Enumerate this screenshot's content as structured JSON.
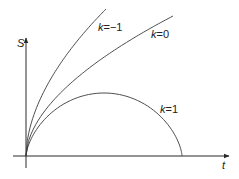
{
  "diagram": {
    "title": "",
    "colors": {
      "axis": "#2a2a2a",
      "curve": "#3a3a3a",
      "background": "#ffffff"
    },
    "origin_px": [
      26,
      156
    ],
    "axes": {
      "y": {
        "label": "S",
        "top_px": 38,
        "label_px": [
          17,
          47
        ]
      },
      "x": {
        "label": "t",
        "left_px": 13,
        "right_px": 229,
        "label_px": [
          222,
          169
        ]
      }
    },
    "curves": [
      {
        "id": "k_minus_1",
        "label_k": "k",
        "label_eq": "=−1",
        "label_px": [
          98,
          31
        ],
        "shape": "power",
        "end_px": [
          106,
          9
        ],
        "exponent": 0.55
      },
      {
        "id": "k_0",
        "label_k": "k",
        "label_eq": "=0",
        "label_px": [
          151,
          38
        ],
        "shape": "power",
        "end_px": [
          173,
          16
        ],
        "exponent": 0.55
      },
      {
        "id": "k_1",
        "label_k": "k",
        "label_eq": "=1",
        "label_px": [
          160,
          113
        ],
        "shape": "cycloid",
        "end_px": [
          182,
          156
        ],
        "peak_height_px": 63
      }
    ]
  }
}
